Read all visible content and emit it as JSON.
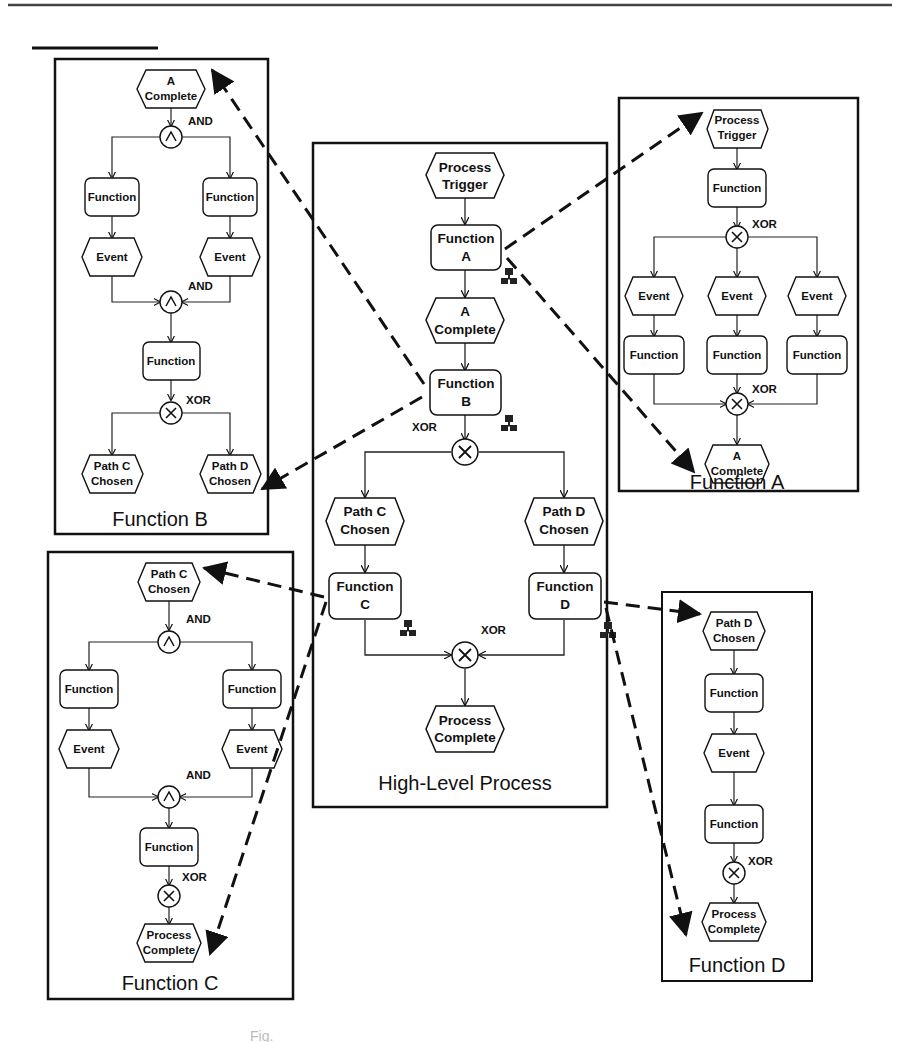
{
  "page": {
    "top_rule": true,
    "caption_partial": "Fig."
  },
  "panels": {
    "high_level": {
      "title": "High-Level Process",
      "nodes": {
        "trigger": [
          "Process",
          "Trigger"
        ],
        "fa": [
          "Function",
          "A"
        ],
        "acomp": [
          "A",
          "Complete"
        ],
        "fb": [
          "Function",
          "B"
        ],
        "pathc": [
          "Path C",
          "Chosen"
        ],
        "pathd": [
          "Path D",
          "Chosen"
        ],
        "fc": [
          "Function",
          "C"
        ],
        "fd": [
          "Function",
          "D"
        ],
        "pcomp": [
          "Process",
          "Complete"
        ]
      },
      "operators": {
        "split": "XOR",
        "join": "XOR"
      }
    },
    "function_a": {
      "title": "Function A",
      "nodes": {
        "trigger": [
          "Process",
          "Trigger"
        ],
        "func": "Function",
        "events": [
          "Event",
          "Event",
          "Event"
        ],
        "funcs": [
          "Function",
          "Function",
          "Function"
        ],
        "complete": [
          "A",
          "Complete"
        ]
      },
      "operators": {
        "split": "XOR",
        "join": "XOR"
      }
    },
    "function_b": {
      "title": "Function B",
      "nodes": {
        "start": [
          "A",
          "Complete"
        ],
        "funcs": [
          "Function",
          "Function"
        ],
        "events": [
          "Event",
          "Event"
        ],
        "func": "Function",
        "pathc": [
          "Path C",
          "Chosen"
        ],
        "pathd": [
          "Path D",
          "Chosen"
        ]
      },
      "operators": {
        "split": "AND",
        "join": "AND",
        "split2": "XOR"
      }
    },
    "function_c": {
      "title": "Function C",
      "nodes": {
        "start": [
          "Path C",
          "Chosen"
        ],
        "funcs": [
          "Function",
          "Function"
        ],
        "events": [
          "Event",
          "Event"
        ],
        "func": "Function",
        "end": [
          "Process",
          "Complete"
        ]
      },
      "operators": {
        "split": "AND",
        "join": "AND",
        "final": "XOR"
      }
    },
    "function_d": {
      "title": "Function D",
      "nodes": {
        "start": [
          "Path D",
          "Chosen"
        ],
        "func1": "Function",
        "event": "Event",
        "func2": "Function",
        "end": [
          "Process",
          "Complete"
        ]
      },
      "operators": {
        "final": "XOR"
      }
    }
  },
  "symbols": {
    "and": "∧",
    "xor": "×"
  },
  "colors": {
    "ink": "#111111",
    "background": "#ffffff"
  }
}
